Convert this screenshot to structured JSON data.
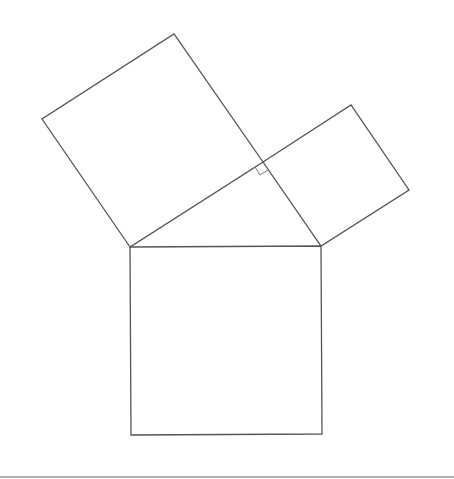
{
  "diagram": {
    "title": "",
    "stroke_color": "#555555",
    "background": "#ffffff",
    "triangle": {
      "vertices": [
        [
          130,
          247
        ],
        [
          321,
          246
        ],
        [
          263,
          162
        ]
      ],
      "right_angle_at": [
        263,
        162
      ]
    },
    "squares": {
      "hypotenuse_square": [
        [
          130,
          247
        ],
        [
          321,
          246
        ],
        [
          322,
          434
        ],
        [
          131,
          435
        ]
      ],
      "left_leg_square": [
        [
          130,
          247
        ],
        [
          42,
          119
        ],
        [
          174,
          34
        ],
        [
          263,
          162
        ]
      ],
      "right_leg_square": [
        [
          263,
          162
        ],
        [
          351,
          105
        ],
        [
          409,
          190
        ],
        [
          321,
          246
        ]
      ]
    },
    "right_angle_marker": [
      [
        255,
        167
      ],
      [
        260,
        175
      ],
      [
        268,
        170
      ]
    ],
    "bottom_rule": {
      "y": 477,
      "x1": 0,
      "x2": 454,
      "color": "#999999"
    }
  }
}
